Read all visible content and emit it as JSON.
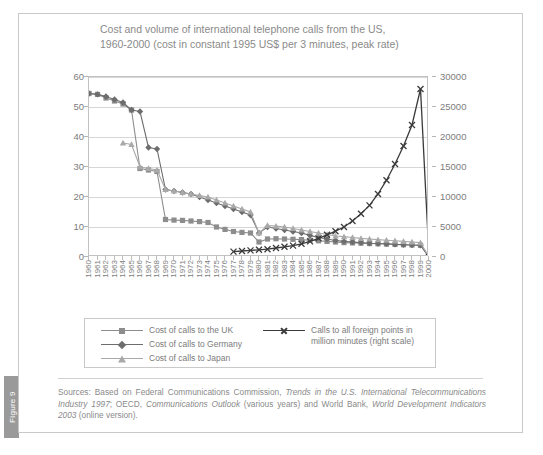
{
  "figure": {
    "tab_label": "Figure 9"
  },
  "chart_data": {
    "type": "line",
    "title": "Cost and volume of international telephone calls from the US, 1960-2000 (cost in constant 1995 US$ per 3 minutes, peak rate)",
    "title_line1": "Cost and volume of international telephone calls from the US,",
    "title_line2": "1960-2000 (cost in constant 1995 US$ per 3 minutes, peak rate)",
    "xlabel": "",
    "ylabel_left": "",
    "ylabel_right": "",
    "grid": true,
    "legend_position": "bottom",
    "ylim_left": [
      0,
      60
    ],
    "ylim_right": [
      0,
      30000
    ],
    "yticks_left": [
      0,
      10,
      20,
      30,
      40,
      50,
      60
    ],
    "yticks_right": [
      0,
      5000,
      10000,
      15000,
      20000,
      25000,
      30000
    ],
    "x": [
      1960,
      1961,
      1962,
      1963,
      1964,
      1965,
      1966,
      1967,
      1968,
      1969,
      1970,
      1971,
      1972,
      1973,
      1974,
      1975,
      1976,
      1977,
      1978,
      1979,
      1980,
      1981,
      1982,
      1983,
      1984,
      1985,
      1986,
      1987,
      1988,
      1989,
      1990,
      1991,
      1992,
      1993,
      1994,
      1995,
      1996,
      1997,
      1998,
      1999,
      2000
    ],
    "x_tick_labels": [
      "1960",
      "1961",
      "1962",
      "1963",
      "1964",
      "1965",
      "1966",
      "1967",
      "1968",
      "1969",
      "1970",
      "1971",
      "1972",
      "1973",
      "1974",
      "1975",
      "1976",
      "1977",
      "1978",
      "1979",
      "1980",
      "1981",
      "1982",
      "1983",
      "1984",
      "1985",
      "1986",
      "1987",
      "1988",
      "1989",
      "1990",
      "1991",
      "1992",
      "1993",
      "1994",
      "1995",
      "1996",
      "1997",
      "1998",
      "1999",
      "2000"
    ],
    "series": [
      {
        "name": "Cost of calls to the UK",
        "marker": "square",
        "color": "#8d8d8d",
        "axis": "left",
        "x": [
          1960,
          1961,
          1962,
          1963,
          1964,
          1965,
          1966,
          1967,
          1968,
          1969,
          1970,
          1971,
          1972,
          1973,
          1974,
          1975,
          1976,
          1977,
          1978,
          1979,
          1980,
          1981,
          1982,
          1983,
          1984,
          1985,
          1986,
          1987,
          1988,
          1989,
          1990,
          1991,
          1992,
          1993,
          1994,
          1995,
          1996,
          1997,
          1998,
          1999,
          2000
        ],
        "values": [
          54.5,
          54.2,
          53.0,
          52.0,
          51.0,
          49.0,
          29.5,
          29.0,
          28.5,
          12.5,
          12.3,
          12.2,
          12.0,
          11.8,
          11.5,
          10.0,
          9.2,
          8.5,
          8.2,
          8.0,
          5.0,
          6.0,
          6.1,
          6.0,
          5.9,
          5.8,
          5.6,
          5.4,
          5.2,
          5.0,
          4.8,
          4.7,
          4.6,
          4.5,
          4.4,
          4.3,
          4.2,
          4.1,
          4.0,
          3.9,
          0
        ]
      },
      {
        "name": "Cost of calls to Germany",
        "marker": "diamond",
        "color": "#6d6d6d",
        "axis": "left",
        "x": [
          1960,
          1961,
          1962,
          1963,
          1964,
          1965,
          1966,
          1967,
          1968,
          1969,
          1970,
          1971,
          1972,
          1973,
          1974,
          1975,
          1976,
          1977,
          1978,
          1979,
          1980,
          1981,
          1982,
          1983,
          1984,
          1985,
          1986,
          1987,
          1988,
          1989,
          1990,
          1991,
          1992,
          1993,
          1994,
          1995,
          1996,
          1997,
          1998,
          1999,
          2000
        ],
        "values": [
          54.5,
          54.2,
          53.5,
          52.5,
          51.5,
          49.0,
          48.5,
          36.5,
          36.0,
          22.5,
          22.0,
          21.5,
          21.0,
          20.0,
          19.0,
          18.0,
          17.0,
          16.0,
          15.0,
          14.0,
          8.0,
          10.0,
          9.5,
          9.0,
          8.5,
          8.0,
          7.2,
          6.5,
          6.0,
          5.5,
          5.2,
          5.0,
          4.8,
          4.6,
          4.5,
          4.4,
          4.2,
          4.1,
          4.0,
          3.9,
          0
        ]
      },
      {
        "name": "Cost of calls to Japan",
        "marker": "triangle",
        "color": "#a9a9a9",
        "axis": "left",
        "x": [
          1964,
          1965,
          1966,
          1967,
          1968,
          1969,
          1970,
          1971,
          1972,
          1973,
          1974,
          1975,
          1976,
          1977,
          1978,
          1979,
          1980,
          1981,
          1982,
          1983,
          1984,
          1985,
          1986,
          1987,
          1988,
          1989,
          1990,
          1991,
          1992,
          1993,
          1994,
          1995,
          1996,
          1997,
          1998,
          1999,
          2000
        ],
        "values": [
          38.0,
          37.5,
          30.0,
          29.5,
          29.0,
          22.5,
          22.0,
          21.5,
          21.0,
          20.5,
          20.0,
          19.0,
          18.0,
          17.0,
          16.0,
          15.0,
          8.0,
          10.5,
          10.3,
          10.0,
          9.5,
          9.0,
          8.5,
          8.0,
          7.5,
          7.0,
          6.8,
          6.5,
          6.2,
          6.0,
          5.8,
          5.6,
          5.4,
          5.2,
          5.0,
          4.8,
          0
        ]
      },
      {
        "name": "Calls to all foreign points in million minutes (right scale)",
        "marker": "x",
        "color": "#3a3a3a",
        "axis": "right",
        "x": [
          1977,
          1978,
          1979,
          1980,
          1981,
          1982,
          1983,
          1984,
          1985,
          1986,
          1987,
          1988,
          1989,
          1990,
          1991,
          1992,
          1993,
          1994,
          1995,
          1996,
          1997,
          1998,
          1999,
          2000
        ],
        "values": [
          900,
          1000,
          1100,
          1200,
          1300,
          1500,
          1700,
          1900,
          2200,
          2600,
          3100,
          3700,
          4300,
          5000,
          6000,
          7200,
          8600,
          10500,
          12800,
          15500,
          18500,
          22000,
          28000,
          0
        ]
      }
    ]
  },
  "legend": {
    "items": [
      {
        "label": "Cost of calls to the UK",
        "marker": "square",
        "color": "#8d8d8d"
      },
      {
        "label": "Cost of calls to Germany",
        "marker": "diamond",
        "color": "#6d6d6d"
      },
      {
        "label": "Cost of calls to Japan",
        "marker": "triangle",
        "color": "#a9a9a9"
      },
      {
        "label": "Calls to all foreign points in million minutes (right scale)",
        "marker": "x",
        "color": "#3a3a3a"
      }
    ]
  },
  "source": {
    "prefix": "Sources: Based on Federal Communications Commission, ",
    "italic1": "Trends in the U.S. International Telecommunications Industry 1997",
    "mid1": "; OECD, ",
    "italic2": "Communications Outlook",
    "mid2": " (various years) and World Bank, ",
    "italic3": "World Development Indicators 2003",
    "suffix": " (online version)."
  }
}
